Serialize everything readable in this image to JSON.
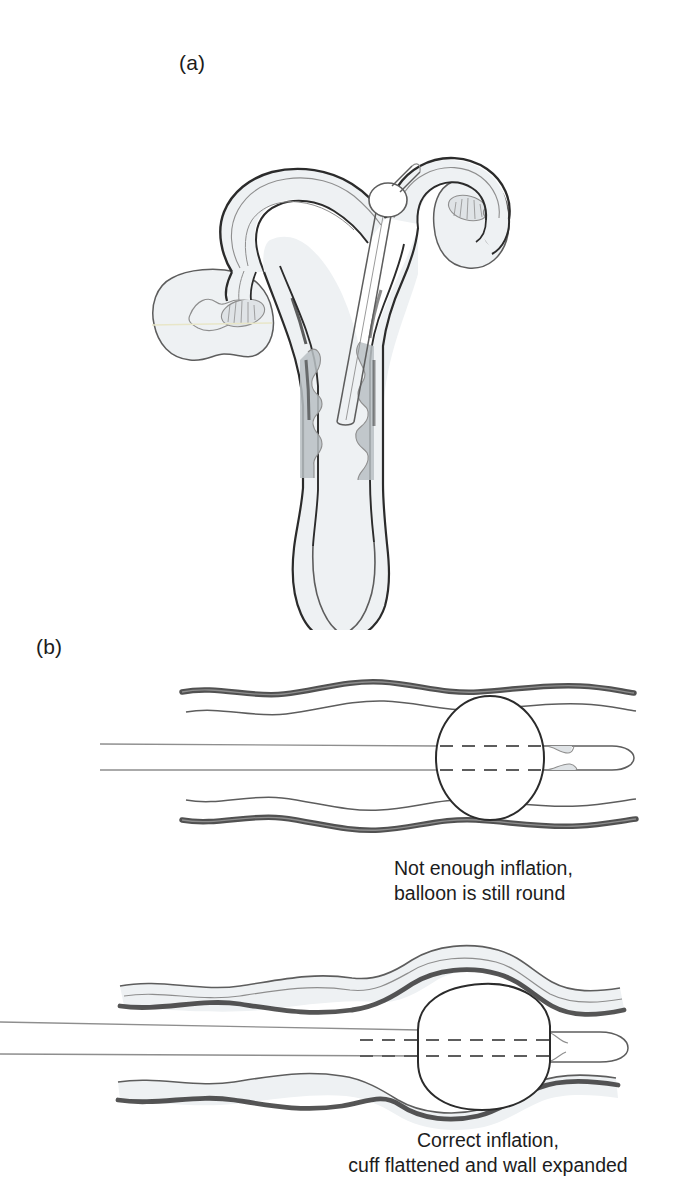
{
  "figure": {
    "kind": "medical-illustration",
    "background_color": "#ffffff",
    "ink_color": "#2b2b2b",
    "tissue_fill": "#eef1f3",
    "shaded_fill": "#b9bfc3"
  },
  "panels": [
    {
      "id": "a",
      "letter": "(a)",
      "subject": "uterus-and-fallopian-tubes-cross-section-with-balloon-catheter",
      "parts": [
        "uterine-fundus",
        "left-fallopian-tube",
        "right-fallopian-tube",
        "left-ovary",
        "right-ovary",
        "endometrial-lining",
        "cervix",
        "vagina",
        "balloon-catheter-shaft",
        "catheter-balloon-at-tubal-ostium"
      ]
    },
    {
      "id": "b",
      "letter": "(b)",
      "subject": "balloon-inflation-comparison-in-tubal-lumen",
      "diagrams": [
        {
          "id": "under-inflated",
          "balloon_shape": "round",
          "wall_state": "undeformed",
          "caption_lines": [
            "Not enough inflation,",
            "balloon is still round"
          ],
          "parts": [
            "upper-tube-wall",
            "lower-tube-wall",
            "catheter-shaft",
            "catheter-tip",
            "balloon",
            "balloon-centerline-dashes"
          ]
        },
        {
          "id": "correctly-inflated",
          "balloon_shape": "flattened-hexagonal",
          "wall_state": "expanded-over-balloon",
          "caption_lines": [
            "Correct inflation,",
            "cuff flattened and wall expanded"
          ],
          "parts": [
            "upper-tube-wall",
            "lower-tube-wall",
            "catheter-shaft",
            "catheter-tip",
            "balloon",
            "balloon-centerline-dashes"
          ]
        }
      ]
    }
  ],
  "captions": {
    "under_inflated": {
      "line1": "Not enough inflation,",
      "line2": "balloon is still round"
    },
    "correct_inflation": {
      "line1": "Correct inflation,",
      "line2": "cuff flattened and wall expanded"
    }
  }
}
